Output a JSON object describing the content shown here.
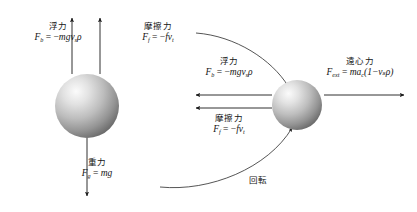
{
  "diagram": {
    "labels": {
      "buoyancy_left": {
        "name": "浮力",
        "lhs": "F",
        "sub": "b",
        "rhs_sign": "−",
        "rhs": "mgv",
        "rhs_sub": "s",
        "rhs_tail": "ρ"
      },
      "friction_left": {
        "name": "摩擦力",
        "lhs": "F",
        "sub": "f",
        "rhs_sign": "−",
        "rhs": "fv",
        "rhs_sub": "t",
        "rhs_tail": ""
      },
      "gravity": {
        "name": "重力",
        "lhs": "F",
        "sub": "g",
        "rhs_sign": "",
        "rhs": "mg",
        "rhs_sub": "",
        "rhs_tail": ""
      },
      "buoyancy_mid": {
        "name": "浮力",
        "lhs": "F",
        "sub": "b",
        "rhs_sign": "−",
        "rhs": "mgv",
        "rhs_sub": "s",
        "rhs_tail": "ρ"
      },
      "friction_mid": {
        "name": "摩擦力",
        "lhs": "F",
        "sub": "f",
        "rhs_sign": "−",
        "rhs": "fv",
        "rhs_sub": "t",
        "rhs_tail": ""
      },
      "centrifugal": {
        "name": "遠心力",
        "lhs": "F",
        "sub": "ext",
        "rhs_sign": "",
        "rhs": "ma",
        "rhs_sub": "c",
        "rhs_tail": "(1−vₛρ)"
      },
      "rotation": {
        "name": "回転"
      }
    },
    "equals": "=",
    "colors": {
      "ink": "#141414",
      "arrow": "#1a1a1a",
      "sphere_light": "#f2f2f2",
      "sphere_mid": "#b3b3b3",
      "sphere_dark": "#6e6e6e",
      "background": "#ffffff"
    },
    "spheres": [
      {
        "name": "settling-sphere",
        "cx": 87,
        "cy": 106,
        "r": 32
      },
      {
        "name": "rotating-sphere",
        "cx": 297,
        "cy": 105,
        "r": 25
      }
    ],
    "arrows": [
      {
        "name": "buoyancy-arrow-left",
        "direction": "up",
        "x1": 72,
        "y1": 74,
        "x2": 72,
        "y2": 18
      },
      {
        "name": "friction-arrow-left",
        "direction": "up",
        "x1": 100,
        "y1": 74,
        "x2": 100,
        "y2": 18
      },
      {
        "name": "gravity-arrow",
        "direction": "down",
        "x1": 87,
        "y1": 138,
        "x2": 87,
        "y2": 196
      },
      {
        "name": "buoyancy-arrow-mid",
        "direction": "left",
        "x1": 272,
        "y1": 95,
        "x2": 196,
        "y2": 95
      },
      {
        "name": "friction-arrow-mid",
        "direction": "left",
        "x1": 272,
        "y1": 108,
        "x2": 196,
        "y2": 108
      },
      {
        "name": "centrifugal-arrow",
        "direction": "right",
        "x1": 324,
        "y1": 95,
        "x2": 404,
        "y2": 95
      }
    ]
  }
}
